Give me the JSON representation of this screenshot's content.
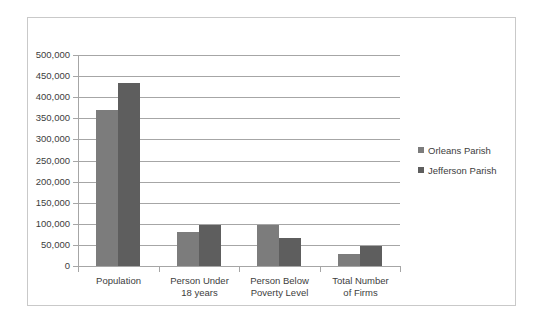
{
  "chart_data": {
    "type": "bar",
    "title": "",
    "xlabel": "",
    "ylabel": "",
    "ylim": [
      0,
      500000
    ],
    "ytick_step": 50000,
    "grid": true,
    "legend_position": "right",
    "categories": [
      "Population",
      "Person Under 18 years",
      "Person Below Poverty Level",
      "Total Number of Firms"
    ],
    "category_lines": [
      [
        "Population"
      ],
      [
        "Person Under",
        "18 years"
      ],
      [
        "Person Below",
        "Poverty Level"
      ],
      [
        "Total Number",
        "of Firms"
      ]
    ],
    "ytick_labels": [
      "500,000",
      "450,000",
      "400,000",
      "350,000",
      "300,000",
      "250,000",
      "200,000",
      "150,000",
      "100,000",
      "50,000",
      "0"
    ],
    "series": [
      {
        "name": "Orleans Parish",
        "color": "#7c7c7c",
        "values": [
          369000,
          80000,
          97000,
          28000
        ]
      },
      {
        "name": "Jefferson Parish",
        "color": "#5e5e5e",
        "values": [
          433000,
          98000,
          66000,
          48000
        ]
      }
    ]
  },
  "legend": {
    "items": [
      {
        "label": "Orleans Parish",
        "color": "#7c7c7c"
      },
      {
        "label": "Jefferson Parish",
        "color": "#5e5e5e"
      }
    ]
  },
  "colors": {
    "grid": "#a6a6a6",
    "axis": "#a6a6a6",
    "frame_border": "#c9c9c9",
    "text": "#3d3d3d",
    "background": "#ffffff"
  }
}
